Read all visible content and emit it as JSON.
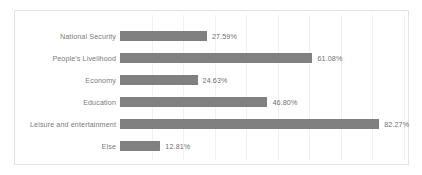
{
  "chart_data": {
    "type": "bar",
    "orientation": "horizontal",
    "title": "",
    "subtitle": "",
    "xlabel": "",
    "ylabel": "",
    "xlim": [
      0,
      100
    ],
    "grid": true,
    "grid_axis": "x",
    "legend": false,
    "legend_position": "none",
    "tick_labels_x": [],
    "tick_labels_y": [
      "National Security",
      "People's Livelihood",
      "Economy",
      "Education",
      "Leisure and entertainment",
      "Else"
    ],
    "categories": [
      "National Security",
      "People's Livelihood",
      "Economy",
      "Education",
      "Leisure and entertainment",
      "Else"
    ],
    "values": [
      27.59,
      61.08,
      24.63,
      46.8,
      82.27,
      12.81
    ],
    "data_labels": [
      "27.59%",
      "61.08%",
      "24.63%",
      "46.80%",
      "82.27%",
      "12.81%"
    ],
    "series": [
      {
        "name": "",
        "values": [
          27.59,
          61.08,
          24.63,
          46.8,
          82.27,
          12.81
        ]
      }
    ],
    "colors": {
      "bar": "#808080",
      "gridline": "#f0f0f0",
      "border": "#e3e3e3",
      "label_text": "#7b7b7b",
      "value_text": "#6f6f6f",
      "background": "#ffffff"
    }
  }
}
